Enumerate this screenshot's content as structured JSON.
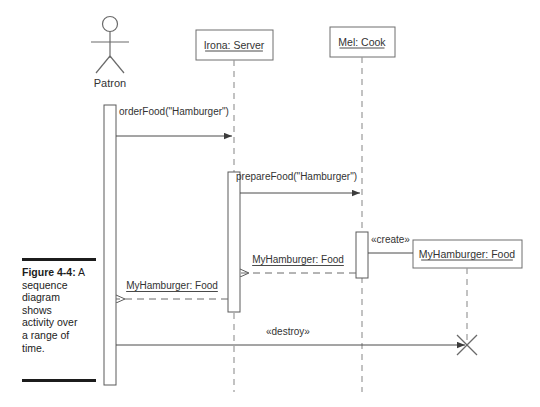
{
  "figure": {
    "label": "Figure 4-4:",
    "caption": "A sequence diagram shows activity over a range of time.",
    "caption_lines": [
      "A sequence",
      "diagram",
      "shows",
      "activity over",
      "a range of",
      "time."
    ]
  },
  "diagram": {
    "type": "uml-sequence-diagram",
    "actor": {
      "name": "Patron",
      "x": 110,
      "activation": {
        "x": 104,
        "y": 105,
        "w": 12,
        "h": 280
      }
    },
    "lifelines": [
      {
        "id": "server",
        "name": "Irona: Server",
        "x": 234,
        "box": {
          "x": 196,
          "y": 30,
          "w": 77,
          "h": 30
        },
        "dash_top": 60,
        "dash_bottom": 392,
        "activations": [
          {
            "x": 228,
            "y": 172,
            "w": 12,
            "h": 140
          }
        ]
      },
      {
        "id": "cook",
        "name": "Mel: Cook",
        "x": 362,
        "box": {
          "x": 330,
          "y": 27,
          "w": 65,
          "h": 30
        },
        "dash_top": 57,
        "dash_bottom": 392,
        "activations": [
          {
            "x": 356,
            "y": 232,
            "w": 12,
            "h": 46
          }
        ]
      },
      {
        "id": "myhamburger",
        "name": "MyHamburger: Food",
        "x": 467,
        "box": {
          "x": 413,
          "y": 240,
          "w": 109,
          "h": 28
        },
        "dash_top": 268,
        "dash_bottom": 392,
        "destroyed_at": 345,
        "activations": []
      }
    ],
    "messages": [
      {
        "id": "order-food",
        "label": "orderFood(\"Hamburger\")",
        "kind": "call",
        "style": "solid",
        "arrowhead": "filled",
        "from_x": 116,
        "to_x": 232,
        "y": 136,
        "label_x": 119,
        "label_y": 115,
        "label_anchor": "start",
        "underline": false
      },
      {
        "id": "prepare-food",
        "label": "prepareFood(\"Hamburger\")",
        "kind": "call",
        "style": "solid",
        "arrowhead": "filled",
        "from_x": 240,
        "to_x": 360,
        "y": 193,
        "label_x": 236,
        "label_y": 180,
        "label_anchor": "start",
        "underline": false
      },
      {
        "id": "create-hamburger",
        "label": "«create»",
        "kind": "create",
        "style": "solid",
        "arrowhead": "none",
        "from_x": 368,
        "to_x": 413,
        "y": 253,
        "label_x": 371,
        "label_y": 243,
        "label_anchor": "start",
        "underline": false
      },
      {
        "id": "return-cook-to-server",
        "label": "MyHamburger: Food",
        "kind": "return",
        "style": "dashed",
        "arrowhead": "open",
        "from_x": 356,
        "to_x": 240,
        "y": 273,
        "label_x": 298,
        "label_y": 263,
        "label_anchor": "middle",
        "underline": true
      },
      {
        "id": "return-server-to-patron",
        "label": "MyHamburger: Food",
        "kind": "return",
        "style": "dashed",
        "arrowhead": "open",
        "from_x": 228,
        "to_x": 116,
        "y": 299,
        "label_x": 172,
        "label_y": 289,
        "label_anchor": "middle",
        "underline": true
      },
      {
        "id": "destroy-hamburger",
        "label": "«destroy»",
        "kind": "destroy",
        "style": "solid",
        "arrowhead": "filled",
        "from_x": 116,
        "to_x": 465,
        "y": 345,
        "label_x": 266,
        "label_y": 335,
        "label_anchor": "start",
        "underline": false
      }
    ]
  },
  "colors": {
    "ink": "#333333",
    "line": "#6a6a6a",
    "dash": "#9a9a9a",
    "rule": "#1c1c1c"
  }
}
